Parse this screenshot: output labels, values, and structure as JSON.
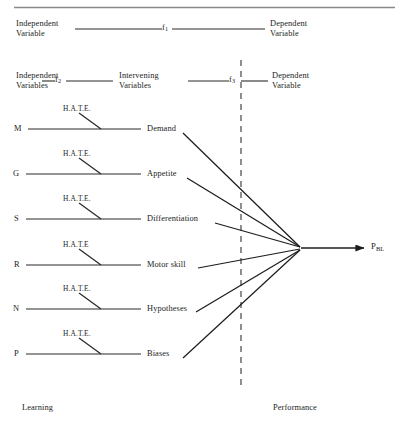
{
  "figure": {
    "top_rule": true,
    "row_f1": {
      "left_label": "Independent\nVariable",
      "link_label": "f",
      "link_sub": "1",
      "right_label": "Dependent\nVariable"
    },
    "row_f2f3": {
      "left_label": "Independent\nVariables",
      "link1_label": "f",
      "link1_sub": "2",
      "middle_label": "Intervening\nVariables",
      "link2_label": "f",
      "link2_sub": "3",
      "right_label": "Dependent\nVariable"
    },
    "moderator_label": "H.A.T.E.",
    "rows": [
      {
        "source": "M",
        "target": "Demand",
        "moderator": "H.A.T.E."
      },
      {
        "source": "G",
        "target": "Appetite",
        "moderator": "H.A.T.E."
      },
      {
        "source": "S",
        "target": "Differentiation",
        "moderator": "H.A.T.E."
      },
      {
        "source": "R",
        "target": "Motor skill",
        "moderator": "H.A.T.E"
      },
      {
        "source": "N",
        "target": "Hypotheses",
        "moderator": "H.A.T.E."
      },
      {
        "source": "P",
        "target": "Biases",
        "moderator": "H.A.T.E."
      }
    ],
    "outcome": {
      "label": "P",
      "sub": "BL"
    },
    "zones": {
      "left": "Learning",
      "right": "Performance"
    },
    "divider": "dashed-vertical",
    "colors": {
      "ink": "#1c1c1c",
      "line": "#2a2a2a",
      "divider": "#666666",
      "rule": "#888888",
      "background": "#ffffff"
    }
  }
}
